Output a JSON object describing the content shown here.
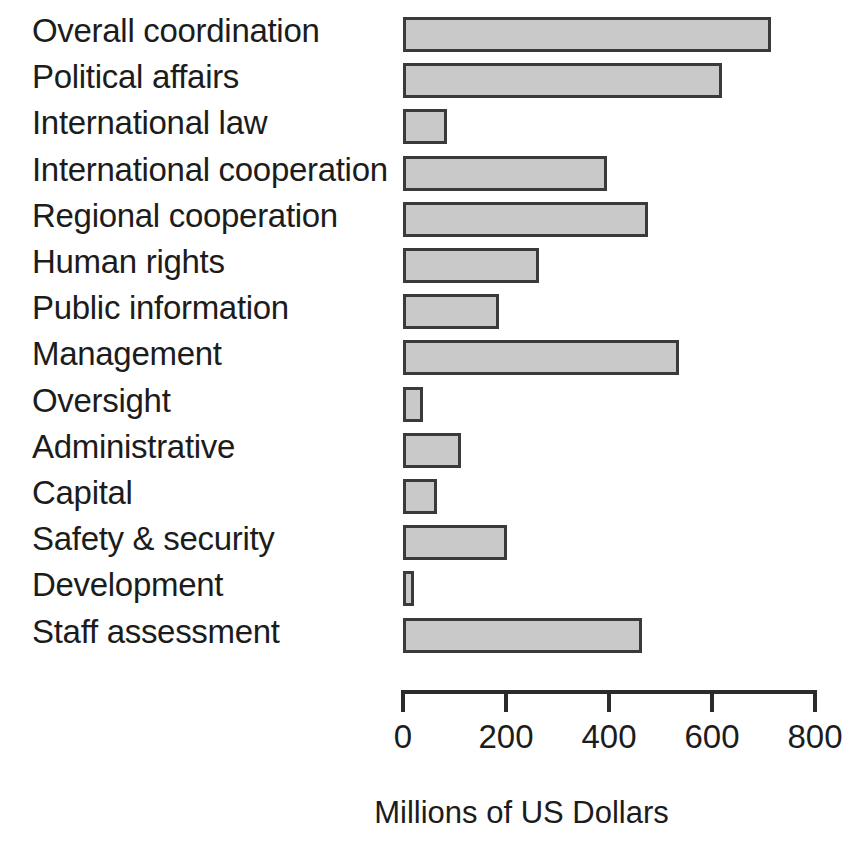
{
  "chart_data": {
    "type": "bar",
    "orientation": "horizontal",
    "title": "",
    "xlabel": "Millions of US Dollars",
    "ylabel": "",
    "xlim": [
      0,
      800
    ],
    "xticks": [
      0,
      200,
      400,
      600,
      800
    ],
    "xtick_labels": [
      "0",
      "200",
      "400",
      "600",
      "800"
    ],
    "grid": false,
    "legend": null,
    "bar_fill_color": "#c9c9c9",
    "bar_edge_color": "#3a3a3a",
    "categories": [
      "Overall coordination",
      "Political affairs",
      "International law",
      "International cooperation",
      "Regional cooperation",
      "Human rights",
      "Public information",
      "Management",
      "Oversight",
      "Administrative",
      "Capital",
      "Safety & security",
      "Development",
      "Staff assessment"
    ],
    "values": [
      715,
      620,
      85,
      396,
      475,
      265,
      187,
      535,
      39,
      112,
      66,
      201,
      21,
      464
    ]
  }
}
